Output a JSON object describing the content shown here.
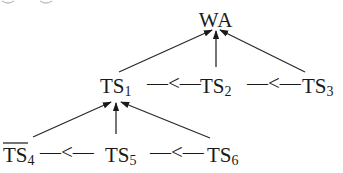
{
  "diagram": {
    "type": "tree",
    "root": {
      "id": "WA",
      "label": "WA"
    },
    "level1": {
      "nodes": [
        {
          "id": "TS1",
          "base": "TS",
          "sub": "1",
          "overline": false
        },
        {
          "id": "TS2",
          "base": "TS",
          "sub": "2",
          "overline": false
        },
        {
          "id": "TS3",
          "base": "TS",
          "sub": "3",
          "overline": false
        }
      ],
      "connector": "—<—",
      "parent": "WA"
    },
    "level2": {
      "nodes": [
        {
          "id": "TS4",
          "base": "TS",
          "sub": "4",
          "overline": true
        },
        {
          "id": "TS5",
          "base": "TS",
          "sub": "5",
          "overline": false
        },
        {
          "id": "TS6",
          "base": "TS",
          "sub": "6",
          "overline": false
        }
      ],
      "connector": "—<—",
      "parent": "TS1"
    },
    "edges": [
      {
        "from": "TS1",
        "to": "WA"
      },
      {
        "from": "TS2",
        "to": "WA"
      },
      {
        "from": "TS3",
        "to": "WA"
      },
      {
        "from": "TS4",
        "to": "TS1"
      },
      {
        "from": "TS5",
        "to": "TS1"
      },
      {
        "from": "TS6",
        "to": "TS1"
      }
    ],
    "ordering": [
      {
        "left": "TS1",
        "relation": "<",
        "right": "TS2"
      },
      {
        "left": "TS2",
        "relation": "<",
        "right": "TS3"
      },
      {
        "left": "TS4",
        "relation": "<",
        "right": "TS5"
      },
      {
        "left": "TS5",
        "relation": "<",
        "right": "TS6"
      }
    ]
  }
}
